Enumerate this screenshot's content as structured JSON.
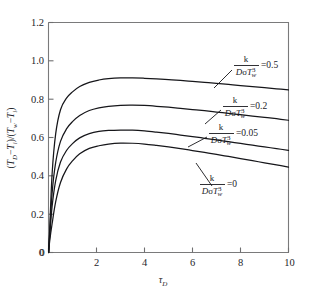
{
  "chart_data": {
    "type": "line",
    "title": "",
    "subtitle": "",
    "xlabel": "τ_D",
    "xlabel_base": "τ",
    "xlabel_sub": "D",
    "ylabel": "(T_D − T_i)/(T_w − T_i)",
    "ylabel_parts": {
      "open1": "(",
      "t1": "T",
      "t1sub": "D",
      "minus1": "−",
      "t2": "T",
      "t2sub": "i",
      "close1": ")/(",
      "t3": "T",
      "t3sub": "w",
      "minus2": "−",
      "t4": "T",
      "t4sub": "i",
      "close2": ")"
    },
    "xlim": [
      0,
      10
    ],
    "ylim": [
      0,
      1.2
    ],
    "xticks": [
      0,
      2,
      4,
      6,
      8,
      10
    ],
    "xticklabels": [
      "0",
      "2",
      "4",
      "6",
      "8",
      "10"
    ],
    "yticks": [
      0,
      0.2,
      0.4,
      0.6,
      0.8,
      1.0,
      1.2
    ],
    "yticklabels": [
      "0",
      "0.2",
      "0.4",
      "0.6",
      "0.8",
      "1.0",
      "1.2"
    ],
    "grid": false,
    "legend_position": "inline-annotations",
    "parameter_symbol": "k/(DσT_w³)",
    "parameter_numerator": "k",
    "parameter_denominator_D": "D",
    "parameter_denominator_sigma": "σ",
    "parameter_denominator_T": "T",
    "parameter_denominator_Tsub": "w",
    "parameter_denominator_Tsup": "3",
    "series": [
      {
        "name": "k/(DσT_w³)=0.5",
        "value_label": "=0.5",
        "x": [
          0.05,
          0.15,
          0.3,
          0.5,
          0.75,
          1.0,
          1.3,
          1.7,
          2.1,
          2.5,
          3.0,
          3.5,
          4.0,
          4.5,
          5.0,
          5.5,
          6.0,
          6.5,
          7.0,
          7.5,
          8.0,
          8.5,
          9.0,
          9.5,
          10.0
        ],
        "y": [
          0.12,
          0.41,
          0.62,
          0.745,
          0.805,
          0.838,
          0.866,
          0.888,
          0.9,
          0.907,
          0.911,
          0.911,
          0.909,
          0.906,
          0.902,
          0.898,
          0.893,
          0.888,
          0.883,
          0.877,
          0.871,
          0.866,
          0.86,
          0.854,
          0.848
        ]
      },
      {
        "name": "k/(DσT_w³)=0.2",
        "value_label": "=0.2",
        "x": [
          0.05,
          0.15,
          0.3,
          0.5,
          0.75,
          1.0,
          1.3,
          1.7,
          2.1,
          2.5,
          3.0,
          3.5,
          4.0,
          4.5,
          5.0,
          5.5,
          6.0,
          6.5,
          7.0,
          7.5,
          8.0,
          8.5,
          9.0,
          9.5,
          10.0
        ],
        "y": [
          0.1,
          0.31,
          0.47,
          0.58,
          0.645,
          0.683,
          0.715,
          0.741,
          0.755,
          0.763,
          0.768,
          0.769,
          0.767,
          0.763,
          0.758,
          0.752,
          0.746,
          0.74,
          0.733,
          0.726,
          0.719,
          0.712,
          0.705,
          0.698,
          0.69
        ]
      },
      {
        "name": "k/(DσT_w³)=0.05",
        "value_label": "=0.05",
        "x": [
          0.05,
          0.15,
          0.3,
          0.5,
          0.75,
          1.0,
          1.3,
          1.7,
          2.1,
          2.5,
          3.0,
          3.5,
          4.0,
          4.5,
          5.0,
          5.5,
          6.0,
          6.5,
          7.0,
          7.5,
          8.0,
          8.5,
          9.0,
          9.5,
          10.0
        ],
        "y": [
          0.085,
          0.24,
          0.375,
          0.472,
          0.532,
          0.568,
          0.598,
          0.62,
          0.632,
          0.637,
          0.639,
          0.638,
          0.634,
          0.628,
          0.621,
          0.613,
          0.605,
          0.596,
          0.587,
          0.578,
          0.569,
          0.56,
          0.551,
          0.542,
          0.533
        ]
      },
      {
        "name": "k/(DσT_w³)=0",
        "value_label": "=0",
        "x": [
          0.05,
          0.15,
          0.3,
          0.5,
          0.75,
          1.0,
          1.3,
          1.7,
          2.1,
          2.5,
          3.0,
          3.5,
          4.0,
          4.5,
          5.0,
          5.5,
          6.0,
          6.5,
          7.0,
          7.5,
          8.0,
          8.5,
          9.0,
          9.5,
          10.0
        ],
        "y": [
          0.06,
          0.15,
          0.265,
          0.365,
          0.435,
          0.478,
          0.515,
          0.543,
          0.557,
          0.566,
          0.571,
          0.57,
          0.566,
          0.559,
          0.551,
          0.542,
          0.532,
          0.522,
          0.512,
          0.501,
          0.49,
          0.479,
          0.468,
          0.457,
          0.446
        ]
      }
    ],
    "annotations": [
      {
        "id": "ann-05",
        "value": "=0.5"
      },
      {
        "id": "ann-02",
        "value": "=0.2"
      },
      {
        "id": "ann-005",
        "value": "=0.05"
      },
      {
        "id": "ann-0",
        "value": "=0"
      }
    ]
  }
}
